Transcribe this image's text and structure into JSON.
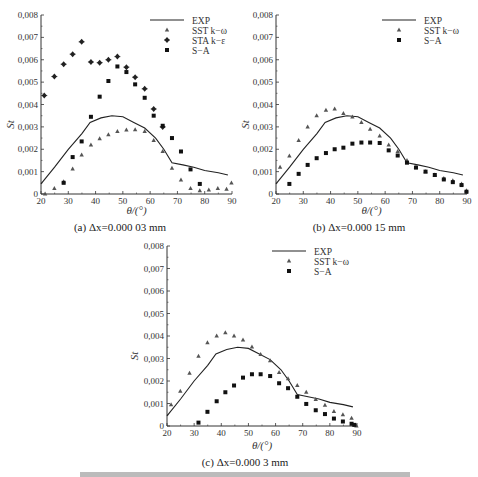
{
  "figure_caption_partial": "图 ... (caption text cut off at bottom edge)",
  "chart_data": [
    {
      "id": "a",
      "type": "scatter",
      "title": "",
      "caption": "(a) Δx=0.000 03 mm",
      "xlabel": "θ/(°)",
      "ylabel": "St",
      "xlim": [
        20,
        90
      ],
      "ylim": [
        0,
        0.008
      ],
      "xticks": [
        "20",
        "30",
        "40",
        "50",
        "60",
        "70",
        "80",
        "90"
      ],
      "yticks": [
        "0",
        "0,001",
        "0,002",
        "0,003",
        "0,004",
        "0,005",
        "0,006",
        "0,007",
        "0,008"
      ],
      "grid": false,
      "legend_position": "upper right",
      "series": [
        {
          "name": "EXP",
          "style": "line",
          "x": [
            20,
            25,
            30,
            35,
            38,
            42,
            46,
            50,
            54,
            58,
            62,
            65,
            68,
            72,
            76,
            80,
            85,
            88.5
          ],
          "y": [
            0.00045,
            0.0012,
            0.002,
            0.0027,
            0.0032,
            0.0034,
            0.0035,
            0.00345,
            0.0032,
            0.00295,
            0.0025,
            0.002,
            0.0014,
            0.0013,
            0.0012,
            0.00105,
            0.00095,
            0.00085
          ]
        },
        {
          "name": "SST k−ω",
          "style": "triangle",
          "x": [
            21.5,
            24.9,
            28.3,
            31.6,
            34.9,
            38.3,
            41.5,
            44.7,
            48,
            51.3,
            54.5,
            58,
            61.3,
            64.6,
            68,
            71.3,
            74.8,
            78.2,
            81.5,
            84.8,
            88,
            89.8
          ],
          "y": [
            0.0,
            0.00025,
            0.00055,
            0.00112,
            0.00175,
            0.0022,
            0.00247,
            0.00265,
            0.0028,
            0.00287,
            0.00288,
            0.0028,
            0.0024,
            0.0019,
            0.00115,
            0.00063,
            0.00025,
            0.00015,
            0.00018,
            0.00025,
            0.00022,
            0.0005
          ]
        },
        {
          "name": "STA k−ε",
          "style": "diamond",
          "x": [
            21.2,
            24.9,
            28.3,
            31.6,
            34.9,
            38.3,
            41.5,
            44.7,
            48,
            51.3,
            54.5,
            58,
            61.3,
            64.6
          ],
          "y": [
            0.0044,
            0.00525,
            0.0058,
            0.00625,
            0.0068,
            0.0059,
            0.00587,
            0.006,
            0.00614,
            0.00567,
            0.00522,
            0.0047,
            0.0038,
            0.003
          ]
        },
        {
          "name": "S−A",
          "style": "square",
          "x": [
            28.3,
            31.6,
            34.9,
            38.3,
            41.5,
            44.7,
            48,
            51.3,
            54.5,
            58,
            61.3,
            64.6,
            68,
            71.3,
            74.8,
            78.2
          ],
          "y": [
            0.0005,
            0.00165,
            0.00235,
            0.00345,
            0.00435,
            0.00505,
            0.0057,
            0.00545,
            0.0049,
            0.0043,
            0.0035,
            0.00305,
            0.0025,
            0.0019,
            0.0011,
            0.00045
          ]
        }
      ]
    },
    {
      "id": "b",
      "type": "scatter",
      "title": "",
      "caption": "(b) Δx=0.000 15 mm",
      "xlabel": "θ/(°)",
      "ylabel": "St",
      "xlim": [
        20,
        90
      ],
      "ylim": [
        0,
        0.008
      ],
      "xticks": [
        "20",
        "30",
        "40",
        "50",
        "60",
        "70",
        "80",
        "90"
      ],
      "yticks": [
        "0",
        "0,001",
        "0,002",
        "0,003",
        "0,004",
        "0,005",
        "0,006",
        "0,007",
        "0,008"
      ],
      "grid": false,
      "legend_position": "upper right",
      "series": [
        {
          "name": "EXP",
          "style": "line",
          "x": [
            20,
            25,
            30,
            35,
            38,
            42,
            46,
            50,
            54,
            58,
            62,
            65,
            68,
            72,
            76,
            80,
            85,
            88.5
          ],
          "y": [
            0.00045,
            0.0012,
            0.002,
            0.0027,
            0.0032,
            0.0034,
            0.0035,
            0.00345,
            0.0032,
            0.00295,
            0.0025,
            0.002,
            0.0014,
            0.0013,
            0.0012,
            0.00105,
            0.00095,
            0.00085
          ]
        },
        {
          "name": "SST k−ω",
          "style": "triangle",
          "x": [
            21.5,
            24.9,
            28.3,
            31.6,
            34.9,
            38.3,
            41.5,
            44.7,
            48,
            51.3,
            54.5,
            58,
            61.3,
            64.6,
            68,
            71.3,
            74.8,
            78.2,
            81.5,
            84.8,
            88,
            89.8
          ],
          "y": [
            0.0012,
            0.0017,
            0.0024,
            0.003,
            0.0035,
            0.00375,
            0.0038,
            0.0036,
            0.00345,
            0.0032,
            0.0029,
            0.0026,
            0.0022,
            0.0019,
            0.0015,
            0.0012,
            0.001,
            0.00085,
            0.0007,
            0.0006,
            0.00045,
            0.00015
          ]
        },
        {
          "name": "S−A",
          "style": "square",
          "x": [
            24.9,
            28.3,
            31.6,
            34.9,
            38.3,
            41.5,
            44.7,
            48,
            51.3,
            54.5,
            58,
            61.3,
            64.6,
            68,
            71.3,
            74.8,
            78.2,
            81.5,
            84.8,
            88,
            89.8
          ],
          "y": [
            0.00045,
            0.0009,
            0.0013,
            0.0016,
            0.00183,
            0.002,
            0.00207,
            0.00225,
            0.0023,
            0.0023,
            0.00228,
            0.00195,
            0.00172,
            0.0014,
            0.00118,
            0.001,
            0.00085,
            0.00065,
            0.00053,
            0.0004,
            0.0001
          ]
        }
      ]
    },
    {
      "id": "c",
      "type": "scatter",
      "title": "",
      "caption": "(c) Δx=0.000 3 mm",
      "xlabel": "θ/(°)",
      "ylabel": "St",
      "xlim": [
        20,
        90
      ],
      "ylim": [
        0,
        0.008
      ],
      "xticks": [
        "20",
        "30",
        "40",
        "50",
        "60",
        "70",
        "80",
        "90"
      ],
      "yticks": [
        "0",
        "0,001",
        "0,002",
        "0,003",
        "0,004",
        "0,005",
        "0,006",
        "0,007",
        "0,008"
      ],
      "grid": false,
      "legend_position": "upper right",
      "series": [
        {
          "name": "EXP",
          "style": "line",
          "x": [
            20,
            25,
            30,
            35,
            38,
            42,
            46,
            50,
            54,
            58,
            62,
            65,
            68,
            72,
            76,
            80,
            85,
            88.5
          ],
          "y": [
            0.00045,
            0.0012,
            0.002,
            0.0027,
            0.0032,
            0.0034,
            0.0035,
            0.00345,
            0.0032,
            0.00295,
            0.0025,
            0.002,
            0.0014,
            0.0013,
            0.0012,
            0.00105,
            0.00095,
            0.00085
          ]
        },
        {
          "name": "SST k−ω",
          "style": "triangle",
          "x": [
            21.5,
            24.9,
            28.3,
            31.6,
            34.9,
            38.3,
            41.5,
            44.7,
            48,
            51.3,
            54.5,
            58,
            61.3,
            64.6,
            68,
            71.3,
            74.8,
            78.2,
            81.5,
            84.8,
            88,
            89.8
          ],
          "y": [
            0.00095,
            0.00155,
            0.00235,
            0.0031,
            0.0037,
            0.004,
            0.00415,
            0.004,
            0.00383,
            0.00352,
            0.00318,
            0.0029,
            0.00238,
            0.0021,
            0.0018,
            0.0015,
            0.00118,
            0.00093,
            0.00065,
            0.0005,
            0.00035,
            0.0
          ]
        },
        {
          "name": "S−A",
          "style": "square",
          "x": [
            31.6,
            34.9,
            38.3,
            41.5,
            44.7,
            48,
            51.3,
            54.5,
            58,
            61.3,
            64.6,
            68,
            71.3,
            74.8,
            78.2,
            81.5,
            84.8,
            88,
            89
          ],
          "y": [
            0.00015,
            0.00063,
            0.0011,
            0.0015,
            0.0018,
            0.00215,
            0.0023,
            0.0023,
            0.00222,
            0.0019,
            0.00168,
            0.0013,
            0.00098,
            0.0007,
            0.00053,
            0.00033,
            0.0002,
            0.0001,
            5e-05
          ]
        }
      ]
    }
  ],
  "layout": {
    "panels": [
      {
        "plot": {
          "left": 41,
          "top": 15,
          "width": 191,
          "height": 179
        },
        "caption_top": 221,
        "caption_left": 0,
        "caption_width": 240,
        "xlabel_top": 206,
        "ylabel_left": 8,
        "legend": {
          "x": 150,
          "y": 20
        }
      },
      {
        "plot": {
          "left": 276,
          "top": 15,
          "width": 191,
          "height": 179
        },
        "caption_top": 221,
        "caption_left": 240,
        "caption_width": 238,
        "xlabel_top": 206,
        "ylabel_left": 243,
        "legend": {
          "x": 382,
          "y": 20
        }
      },
      {
        "plot": {
          "left": 167,
          "top": 246,
          "width": 190,
          "height": 180
        },
        "caption_top": 456,
        "caption_left": 120,
        "caption_width": 250,
        "xlabel_top": 441,
        "ylabel_left": 132,
        "legend": {
          "x": 272,
          "y": 251
        }
      }
    ],
    "colors": {
      "ink": "#333333",
      "line": "#222222",
      "marker": "#333333"
    }
  }
}
